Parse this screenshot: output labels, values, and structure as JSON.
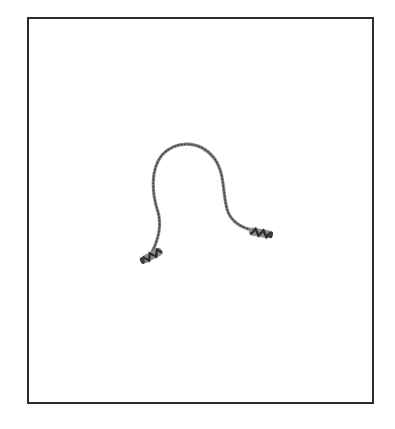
{
  "image": {
    "subject": "jump rope",
    "description": "Beaded jump rope with two dark striped handles forming an arch shape, centered in a black-bordered frame on white background",
    "colors": {
      "background": "#ffffff",
      "frame_border": "#2b2b2b",
      "rope": "#8a8a8a",
      "rope_dark": "#555555",
      "handle_dark": "#3a3a3a",
      "handle_light": "#9a9a9a"
    }
  }
}
